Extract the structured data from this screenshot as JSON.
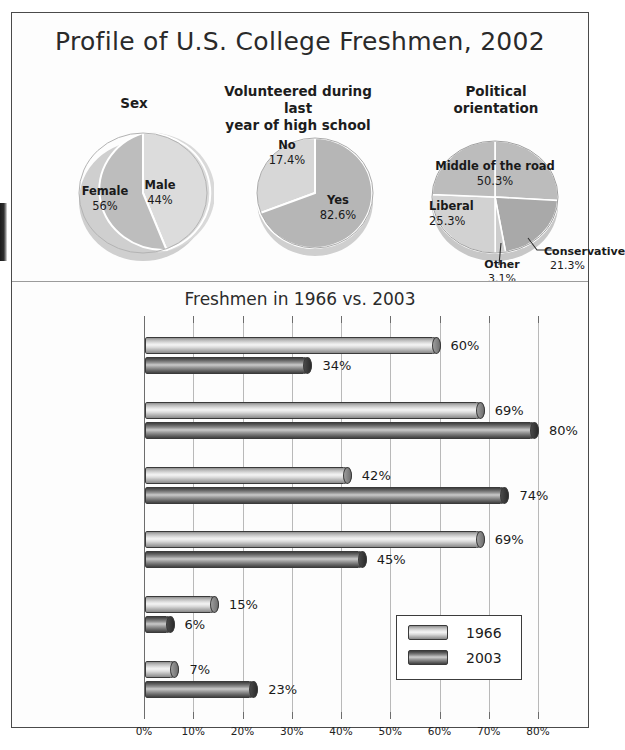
{
  "poster": {
    "title": "Profile of U.S. College Freshmen, 2002"
  },
  "pies": [
    {
      "heading": "Sex",
      "slices": [
        {
          "name": "Male",
          "value": "44%",
          "pct": 44
        },
        {
          "name": "Female",
          "value": "56%",
          "pct": 56
        }
      ]
    },
    {
      "heading": "Volunteered during last\nyear of high school",
      "heading_line1": "Volunteered during last",
      "heading_line2": "year of high school",
      "slices": [
        {
          "name": "No",
          "value": "17.4%",
          "pct": 17.4
        },
        {
          "name": "Yes",
          "value": "82.6%",
          "pct": 82.6
        }
      ]
    },
    {
      "heading_line1": "Political",
      "heading_line2": "orientation",
      "slices": [
        {
          "name": "Middle of the road",
          "value": "50.3%",
          "pct": 50.3
        },
        {
          "name": "Conservative",
          "value": "21.3%",
          "pct": 21.3
        },
        {
          "name": "Other",
          "value": "3.1%",
          "pct": 3.1
        },
        {
          "name": "Liberal",
          "value": "25.3%",
          "pct": 25.3
        }
      ]
    }
  ],
  "chart_data": {
    "type": "bar",
    "orientation": "horizontal",
    "title": "Freshmen in 1966 vs. 2003",
    "xlabel": "",
    "ylabel": "",
    "xlim": [
      0,
      80
    ],
    "xticks": [
      "0%",
      "10%",
      "20%",
      "30%",
      "40%",
      "50%",
      "60%",
      "70%",
      "80%"
    ],
    "grid": true,
    "legend_position": "inside-lower-right",
    "categories": [
      "Feel it's important to keep up with politics",
      "Attended church services during the last year of high school.",
      "Want to be well off financially",
      "Drank beer in the last year",
      "Smoked cigarettes in the last year",
      "Average grade in high school was A or A+"
    ],
    "category_lines": [
      [
        "Feel it's important",
        "to keep up with",
        "politics"
      ],
      [
        "Attended church",
        "services during the",
        "last year of",
        "high school."
      ],
      [
        "Want to be well",
        "off financially"
      ],
      [
        "Drank beer in",
        "the last year"
      ],
      [
        "Smoked cigarettes",
        "in the last year"
      ],
      [
        "Average grade",
        "in high school",
        "was A or A+"
      ]
    ],
    "series": [
      {
        "name": "1966",
        "values": [
          60,
          69,
          42,
          69,
          15,
          7
        ],
        "labels": [
          "60%",
          "69%",
          "42%",
          "69%",
          "15%",
          "7%"
        ]
      },
      {
        "name": "2003",
        "values": [
          34,
          80,
          74,
          45,
          6,
          23
        ],
        "labels": [
          "34%",
          "80%",
          "74%",
          "45%",
          "6%",
          "23%"
        ]
      }
    ]
  },
  "legend": {
    "entries": [
      {
        "label": "1966"
      },
      {
        "label": "2003"
      }
    ]
  }
}
